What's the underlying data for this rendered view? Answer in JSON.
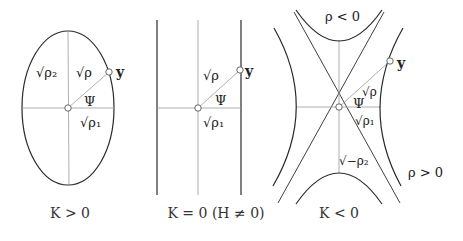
{
  "figure": {
    "panels": [
      {
        "id": "elliptic",
        "caption": "K > 0",
        "labels": {
          "sqrt_rho2": "√ρ₂",
          "sqrt_rho": "√ρ",
          "psi": "Ψ",
          "sqrt_rho1": "√ρ₁",
          "point": "y"
        }
      },
      {
        "id": "parabolic",
        "caption": "K = 0 (H ≠ 0)",
        "labels": {
          "sqrt_rho": "√ρ",
          "psi": "Ψ",
          "sqrt_rho1": "√ρ₁",
          "point": "y"
        }
      },
      {
        "id": "hyperbolic",
        "caption": "K < 0",
        "labels": {
          "rho_neg": "ρ < 0",
          "rho_pos": "ρ > 0",
          "sqrt_rho": "√ρ",
          "psi": "Ψ",
          "sqrt_rho1": "√ρ₁",
          "sqrt_neg_rho2": "√−ρ₂",
          "point": "y"
        }
      }
    ],
    "colors": {
      "curve": "#2a2a2a",
      "axis": "#9a9a9a",
      "text": "#222222"
    }
  }
}
